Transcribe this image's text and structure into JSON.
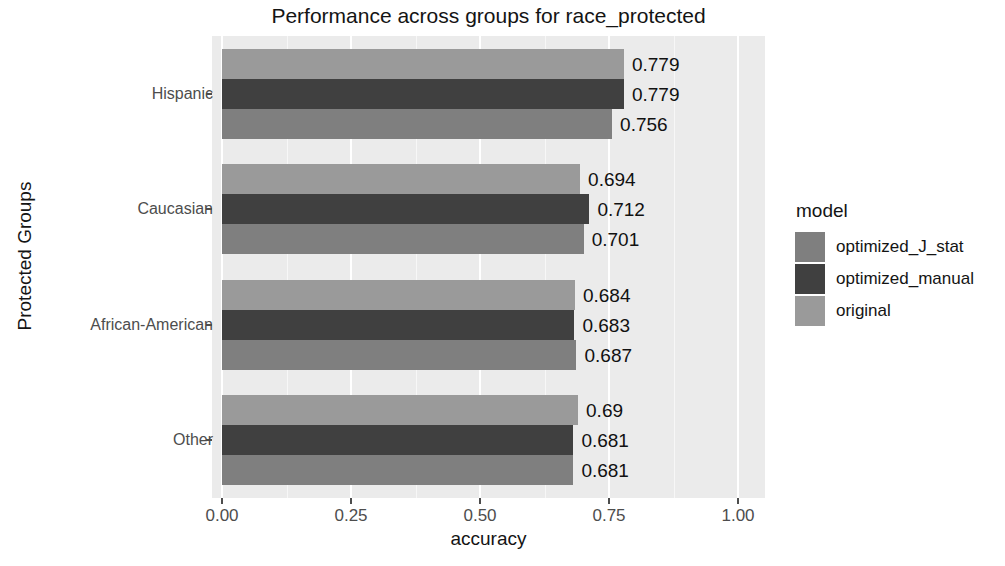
{
  "chart_data": {
    "type": "bar",
    "orientation": "horizontal",
    "title": "Performance across groups for race_protected",
    "xlabel": "accuracy",
    "ylabel": "Protected Groups",
    "categories": [
      "Hispanic",
      "Caucasian",
      "African-American",
      "Other"
    ],
    "xlim": [
      0,
      1.08
    ],
    "xticks": [
      0.0,
      0.25,
      0.5,
      0.75,
      1.0
    ],
    "xtick_labels": [
      "0.00",
      "0.25",
      "0.50",
      "0.75",
      "1.00"
    ],
    "grid": true,
    "legend": {
      "title": "model",
      "position": "right",
      "entries": [
        "optimized_J_stat",
        "optimized_manual",
        "original"
      ]
    },
    "series": [
      {
        "name": "optimized_J_stat",
        "color": "#7f7f7f",
        "values": [
          0.756,
          0.701,
          0.687,
          0.681
        ],
        "labels": [
          "0.756",
          "0.701",
          "0.687",
          "0.681"
        ]
      },
      {
        "name": "optimized_manual",
        "color": "#404040",
        "values": [
          0.779,
          0.712,
          0.683,
          0.681
        ],
        "labels": [
          "0.779",
          "0.712",
          "0.683",
          "0.681"
        ]
      },
      {
        "name": "original",
        "color": "#9a9a9a",
        "values": [
          0.779,
          0.694,
          0.684,
          0.69
        ],
        "labels": [
          "0.779",
          "0.694",
          "0.684",
          "0.69"
        ]
      }
    ],
    "panel_background": "#ebebeb",
    "gridline_color": "#ffffff"
  }
}
